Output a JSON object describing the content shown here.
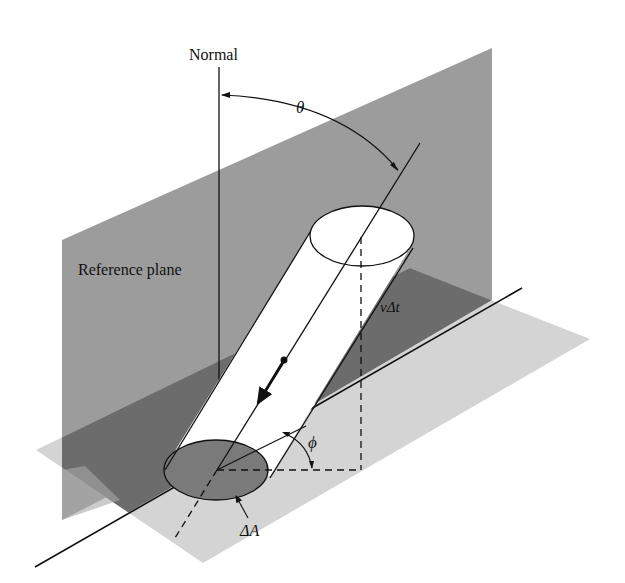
{
  "diagram": {
    "labels": {
      "normal": "Normal",
      "theta": "θ",
      "reference_plane": "Reference plane",
      "v_delta_t": "vΔt",
      "phi": "ϕ",
      "delta_a": "ΔA"
    },
    "colors": {
      "background": "#ffffff",
      "vertical_plane": "#9c9c9c",
      "horizontal_plane": "#d2d2d2",
      "overlap_dark": "#6e6e6e",
      "delta_a_fill": "#777777",
      "cylinder_fill": "#ffffff",
      "line": "#111111"
    }
  }
}
